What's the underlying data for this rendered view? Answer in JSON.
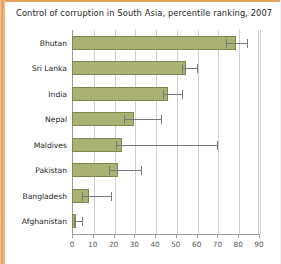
{
  "chart_data": {
    "type": "bar",
    "orientation": "horizontal",
    "title": "Control of corruption in South Asia, percentile ranking, 2007",
    "xlabel": "",
    "ylabel": "",
    "xlim": [
      0,
      90
    ],
    "xticks": [
      0,
      10,
      20,
      30,
      40,
      50,
      60,
      70,
      80,
      90
    ],
    "grid": true,
    "legend": false,
    "categories": [
      "Bhutan",
      "Sri Lanka",
      "India",
      "Nepal",
      "Maldives",
      "Pakistan",
      "Bangladesh",
      "Afghanistan"
    ],
    "values": [
      79,
      55,
      46,
      30,
      24,
      22,
      8,
      2
    ],
    "error_low": [
      74,
      53,
      44,
      25,
      21,
      18,
      5,
      1
    ],
    "error_high": [
      84,
      60,
      53,
      43,
      70,
      33,
      19,
      5
    ],
    "bar_color": "#a9b173",
    "bar_edge_color": "#7f8751",
    "error_color": "#77787b",
    "accent_color": "#e89a52"
  },
  "axis": {
    "tick_labels": [
      "0",
      "10",
      "20",
      "30",
      "40",
      "50",
      "60",
      "70",
      "80",
      "90"
    ]
  }
}
